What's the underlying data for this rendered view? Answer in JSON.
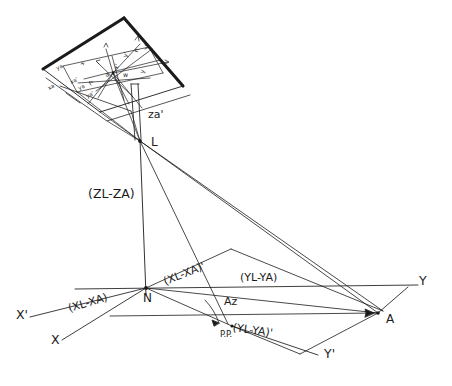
{
  "diagram": {
    "ink_color": "#1b1b1b",
    "background": "#ffffff",
    "points": {
      "exposure_station": "L",
      "nadir": "N",
      "principal_point": "P.P.",
      "ground_point": "A"
    },
    "axes": {
      "x": "X",
      "x_prime": "X'",
      "y": "Y",
      "y_prime": "Y'"
    },
    "labels": {
      "zl_minus_za": "(ZL-ZA)",
      "xl_minus_xa": "(XL-XA)",
      "xl_minus_xa_prime": "(XL-XA)'",
      "yl_minus_ya": "(YL-YA)",
      "yl_minus_ya_prime": "(YL-YA)'",
      "za_prime": "za'",
      "azimuth": "Az",
      "a_sub_z": "Az"
    },
    "photo_plane_labels": {
      "ya": "ya",
      "xa": "xa",
      "ya_prime": "ya'",
      "xa_prime": "xa'",
      "x_axis": "x",
      "y_axis": "y",
      "x_prime_axis": "x'",
      "y_prime_axis": "y'",
      "point_a": "a",
      "eta": "n",
      "omega": "w"
    }
  }
}
